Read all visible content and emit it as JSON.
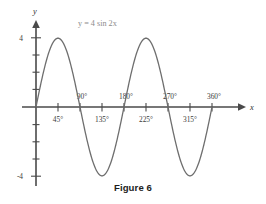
{
  "figure": {
    "caption": "Figure 6",
    "equation_label": "y = 4 sin 2x",
    "x_axis_name": "x",
    "y_axis_name": "y",
    "curve_color": "#6e6e6e",
    "axis_color": "#4a4a4a",
    "label_color": "#3b3b3b",
    "equation_color": "#8c8c8c"
  },
  "chart_data": {
    "type": "line",
    "title": "Figure 6",
    "annotations": [
      "y = 4 sin 2x"
    ],
    "xlabel": "x",
    "ylabel": "y",
    "xlim": [
      0,
      360
    ],
    "ylim": [
      -4,
      4
    ],
    "grid": false,
    "legend": "none",
    "x_tick_labels": [
      "45°",
      "90°",
      "135°",
      "180°",
      "225°",
      "270°",
      "315°",
      "360°"
    ],
    "x_tick_values": [
      45,
      90,
      135,
      180,
      225,
      270,
      315,
      360
    ],
    "x_tick_label_placement": [
      "below",
      "above",
      "below",
      "above",
      "below",
      "above",
      "below",
      "above"
    ],
    "y_tick_labels": [
      "4",
      "-4"
    ],
    "y_tick_values": [
      4,
      -4
    ],
    "y_tick_marks": [
      -4,
      -3,
      -2,
      -1,
      1,
      2,
      3,
      4
    ],
    "series": [
      {
        "name": "y = 4 sin 2x",
        "formula": "y = 4*sin(2x)",
        "amplitude": 4,
        "period_degrees": 180,
        "x": [
          0,
          15,
          30,
          45,
          60,
          75,
          90,
          105,
          120,
          135,
          150,
          165,
          180,
          195,
          210,
          225,
          240,
          255,
          270,
          285,
          300,
          315,
          330,
          345,
          360
        ],
        "values": [
          0,
          2,
          3.46,
          4,
          3.46,
          2,
          0,
          -2,
          -3.46,
          -4,
          -3.46,
          -2,
          0,
          2,
          3.46,
          4,
          3.46,
          2,
          0,
          -2,
          -3.46,
          -4,
          -3.46,
          -2,
          0
        ]
      }
    ],
    "key_points": {
      "maxima_degrees": [
        45,
        225
      ],
      "minima_degrees": [
        135,
        315
      ],
      "zeros_degrees": [
        0,
        90,
        180,
        270,
        360
      ]
    }
  }
}
